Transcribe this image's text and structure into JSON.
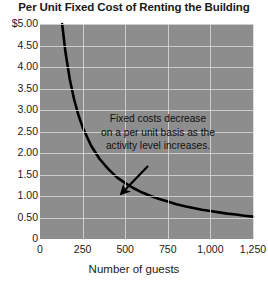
{
  "chart_data": {
    "type": "line",
    "title": "Per Unit Fixed Cost of Renting the Building",
    "xlabel": "Number of guests",
    "ylabel": "",
    "xlim": [
      0,
      1250
    ],
    "ylim": [
      0,
      5.0
    ],
    "grid": true,
    "legend": false,
    "plot_background_color": "#8d8d8d",
    "gridline_color": "#d8d8d8",
    "line_color": "#000000",
    "x_ticks": [
      "0",
      "250",
      "500",
      "750",
      "1,000",
      "1,250"
    ],
    "x_tick_values": [
      0,
      250,
      500,
      750,
      1000,
      1250
    ],
    "y_ticks": [
      "$5.00",
      "4.50",
      "4.00",
      "3.50",
      "3.00",
      "2.50",
      "2.00",
      "1.50",
      "1.00",
      "0.50",
      "0"
    ],
    "y_tick_values": [
      5.0,
      4.5,
      4.0,
      3.5,
      3.0,
      2.5,
      2.0,
      1.5,
      1.0,
      0.5,
      0
    ],
    "series": [
      {
        "name": "Per unit fixed cost",
        "total_fixed_cost": 650,
        "x": [
          130,
          150,
          175,
          200,
          225,
          250,
          300,
          350,
          400,
          450,
          500,
          550,
          600,
          650,
          700,
          750,
          800,
          850,
          900,
          950,
          1000,
          1050,
          1100,
          1150,
          1200,
          1250
        ],
        "values": [
          5.0,
          4.33,
          3.71,
          3.25,
          2.89,
          2.6,
          2.17,
          1.86,
          1.63,
          1.44,
          1.3,
          1.18,
          1.08,
          1.0,
          0.93,
          0.87,
          0.81,
          0.76,
          0.72,
          0.68,
          0.65,
          0.62,
          0.59,
          0.57,
          0.54,
          0.52
        ]
      }
    ],
    "annotations": [
      {
        "name": "fixed-cost-note",
        "lines": [
          "Fixed costs decrease",
          "on a per unit basis as the",
          "activity level increases."
        ],
        "arrow": {
          "from_x": 148,
          "from_y": 166,
          "to_x": 122,
          "to_y": 193
        }
      }
    ]
  }
}
